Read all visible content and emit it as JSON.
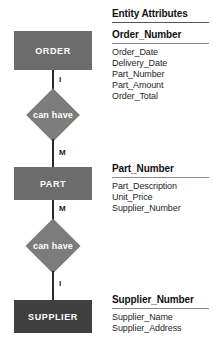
{
  "diagram": {
    "title_column": "Entity Attributes",
    "entities": [
      {
        "name": "ORDER",
        "shade": "light"
      },
      {
        "name": "PART",
        "shade": "light"
      },
      {
        "name": "SUPPLIER",
        "shade": "dark"
      }
    ],
    "relationships": [
      {
        "label": "can have",
        "from_cardinality": "I",
        "to_cardinality": "M"
      },
      {
        "label": "can have",
        "from_cardinality": "M",
        "to_cardinality": "I"
      }
    ],
    "cardinalities": {
      "order_to_rel1": "I",
      "rel1_to_part": "M",
      "part_to_rel2": "M",
      "rel2_to_supplier": "I"
    },
    "colors": {
      "entity_light": "#6c6c6c",
      "entity_dark": "#3f3f3f",
      "relationship": "#7c7c7c",
      "connector": "#2b2b2b",
      "text_on_shape": "#ffffff",
      "text_body": "#1f1f1f"
    }
  },
  "attributes": {
    "column_header": "Entity Attributes",
    "groups": [
      {
        "key": "Order_Number",
        "items": [
          "Order_Date",
          "Delivery_Date",
          "Part_Number",
          "Part_Amount",
          "Order_Total"
        ]
      },
      {
        "key": "Part_Number",
        "items": [
          "Part_Description",
          "Unit_Price",
          "Supplier_Number"
        ]
      },
      {
        "key": "Supplier_Number",
        "items": [
          "Supplier_Name",
          "Supplier_Address"
        ]
      }
    ]
  }
}
